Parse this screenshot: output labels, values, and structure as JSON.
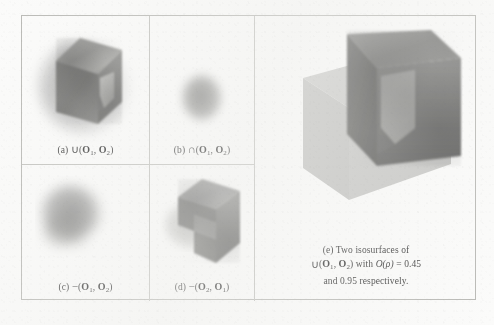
{
  "figure": {
    "panels": [
      {
        "id": "a",
        "label": "(a)",
        "operator": "∪",
        "operands": [
          "O",
          "O"
        ],
        "subscripts": [
          "1",
          "2"
        ],
        "caption_plain": "(a) ∪ (O₁, O₂)",
        "render": "solid-cube-with-notch-and-soft-halo"
      },
      {
        "id": "b",
        "label": "(b)",
        "operator": "∩",
        "operands": [
          "O",
          "O"
        ],
        "subscripts": [
          "1",
          "2"
        ],
        "caption_plain": "(b) ∩ (O₁, O₂)",
        "render": "small-fuzzy-hexagonal-blob"
      },
      {
        "id": "c",
        "label": "(c)",
        "operator": "−",
        "operands": [
          "O",
          "O"
        ],
        "subscripts": [
          "1",
          "2"
        ],
        "caption_plain": "(c) − (O₁, O₂)",
        "render": "diffuse-blurred-blob"
      },
      {
        "id": "d",
        "label": "(d)",
        "operator": "−",
        "operands": [
          "O",
          "O"
        ],
        "subscripts": [
          "2",
          "1"
        ],
        "caption_plain": "(d) − (O₂, O₁)",
        "render": "notched-L-shaped-solid"
      },
      {
        "id": "e",
        "label": "(e)",
        "caption_line1": "(e) Two isosurfaces of",
        "caption_line2_prefix": "∪ (",
        "caption_line2_mid": ") with ",
        "caption_line2_func": "O",
        "caption_line2_arg": "(ρ)",
        "caption_line2_eq": " = 0.45",
        "caption_line3": "and 0.95 respectively.",
        "isovalues": [
          "0.45",
          "0.95"
        ],
        "operator": "∪",
        "operands": [
          "O",
          "O"
        ],
        "subscripts": [
          "1",
          "2"
        ],
        "render": "two-nested-translucent-cubes"
      }
    ],
    "colors": {
      "page_background": "#fbfbfa",
      "frame_border": "#b9b9b5",
      "divider": "#c3c3bf",
      "text": "#3a3a3a",
      "solid_fill": "#7b7b79",
      "ghost_fill": "#a8a8a5"
    }
  }
}
